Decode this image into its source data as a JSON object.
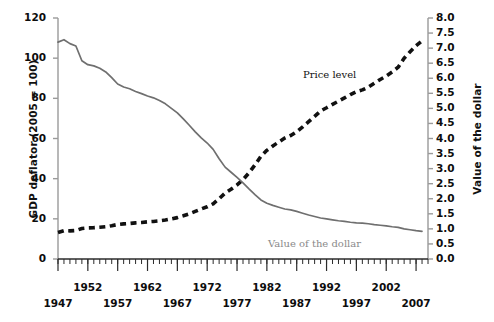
{
  "chart_data": {
    "type": "line",
    "title": "",
    "xlabel": "",
    "ylabel": "GDP deflator (2005 = 100)",
    "y2label": "Value of the dollar",
    "xlim": [
      1947,
      2009
    ],
    "ylim": [
      0,
      120
    ],
    "y2lim": [
      0.0,
      8.0
    ],
    "grid": false,
    "legend": "inline-annotations",
    "x_major_ticks": [
      1947,
      1952,
      1957,
      1962,
      1967,
      1972,
      1977,
      1982,
      1987,
      1992,
      1997,
      2002,
      2007
    ],
    "x_tick_labels": [
      "1947",
      "1952",
      "1957",
      "1962",
      "1967",
      "1972",
      "1977",
      "1982",
      "1987",
      "1992",
      "1997",
      "2002",
      "2007"
    ],
    "x_minor_tick_interval": 1,
    "y_left_ticks": [
      0,
      20,
      40,
      60,
      80,
      100,
      120
    ],
    "y_left_tick_labels": [
      "0",
      "20",
      "40",
      "60",
      "80",
      "100",
      "120"
    ],
    "y_right_ticks": [
      0.0,
      0.5,
      1.0,
      1.5,
      2.0,
      2.5,
      3.0,
      3.5,
      4.0,
      4.5,
      5.0,
      5.5,
      6.0,
      6.5,
      7.0,
      7.5,
      8.0
    ],
    "y_right_tick_labels": [
      "0.0",
      "0.5",
      "1.0",
      "1.5",
      "2.0",
      "2.5",
      "3.0",
      "3.5",
      "4.0",
      "4.5",
      "5.0",
      "5.5",
      "6.0",
      "6.5",
      "7.0",
      "7.5",
      "8.0"
    ],
    "series": [
      {
        "name": "Price level",
        "axis": "left",
        "style": "dashed",
        "color": "#111111",
        "x": [
          1947,
          1948,
          1949,
          1950,
          1951,
          1952,
          1953,
          1954,
          1955,
          1956,
          1957,
          1958,
          1959,
          1960,
          1961,
          1962,
          1963,
          1964,
          1965,
          1966,
          1967,
          1968,
          1969,
          1970,
          1971,
          1972,
          1973,
          1974,
          1975,
          1976,
          1977,
          1978,
          1979,
          1980,
          1981,
          1982,
          1983,
          1984,
          1985,
          1986,
          1987,
          1988,
          1989,
          1990,
          1991,
          1992,
          1993,
          1994,
          1995,
          1996,
          1997,
          1998,
          1999,
          2000,
          2001,
          2002,
          2003,
          2004,
          2005,
          2006,
          2007,
          2008
        ],
        "values": [
          13.2,
          14.1,
          14.0,
          14.2,
          15.2,
          15.5,
          15.6,
          15.8,
          16.1,
          16.6,
          17.2,
          17.5,
          17.7,
          18.0,
          18.2,
          18.5,
          18.7,
          19.0,
          19.4,
          20.0,
          20.6,
          21.5,
          22.5,
          23.7,
          24.9,
          26.0,
          27.5,
          30.0,
          32.8,
          34.7,
          36.9,
          39.5,
          42.9,
          46.8,
          51.1,
          54.1,
          56.3,
          58.3,
          60.2,
          61.5,
          63.4,
          65.8,
          68.4,
          71.0,
          73.7,
          75.3,
          77.0,
          78.6,
          80.2,
          81.9,
          83.3,
          84.2,
          85.6,
          87.5,
          89.4,
          91.1,
          93.1,
          95.5,
          100.0,
          103.2,
          106.2,
          108.6
        ]
      },
      {
        "name": "Value of the dollar",
        "axis": "right",
        "style": "solid",
        "color": "#6f6f6f",
        "x": [
          1947,
          1948,
          1949,
          1950,
          1951,
          1952,
          1953,
          1954,
          1955,
          1956,
          1957,
          1958,
          1959,
          1960,
          1961,
          1962,
          1963,
          1964,
          1965,
          1966,
          1967,
          1968,
          1969,
          1970,
          1971,
          1972,
          1973,
          1974,
          1975,
          1976,
          1977,
          1978,
          1979,
          1980,
          1981,
          1982,
          1983,
          1984,
          1985,
          1986,
          1987,
          1988,
          1989,
          1990,
          1991,
          1992,
          1993,
          1994,
          1995,
          1996,
          1997,
          1998,
          1999,
          2000,
          2001,
          2002,
          2003,
          2004,
          2005,
          2006,
          2007,
          2008
        ],
        "values": [
          7.2,
          7.28,
          7.15,
          7.07,
          6.58,
          6.45,
          6.41,
          6.33,
          6.21,
          6.02,
          5.81,
          5.71,
          5.65,
          5.56,
          5.49,
          5.41,
          5.35,
          5.26,
          5.15,
          5.0,
          4.85,
          4.65,
          4.44,
          4.22,
          4.02,
          3.85,
          3.64,
          3.33,
          3.05,
          2.88,
          2.71,
          2.53,
          2.33,
          2.14,
          1.96,
          1.85,
          1.78,
          1.72,
          1.66,
          1.63,
          1.58,
          1.52,
          1.46,
          1.41,
          1.36,
          1.33,
          1.3,
          1.27,
          1.25,
          1.22,
          1.2,
          1.19,
          1.17,
          1.14,
          1.12,
          1.1,
          1.07,
          1.05,
          1.0,
          0.97,
          0.94,
          0.92
        ]
      }
    ],
    "annotations": [
      {
        "text": "Price level",
        "series": "Price level"
      },
      {
        "text": "Value of the dollar",
        "series": "Value of the dollar"
      }
    ]
  },
  "labels": {
    "left_axis_title": "GDP deflator (2005 = 100)",
    "right_axis_title": "Value of the dollar",
    "price_level_note": "Price level",
    "value_dollar_note": "Value of the dollar"
  },
  "colors": {
    "price_level_line": "#111111",
    "value_dollar_line": "#6f6f6f",
    "axis": "#9a9a9a",
    "text": "#0d0d0d",
    "background": "#ffffff"
  }
}
